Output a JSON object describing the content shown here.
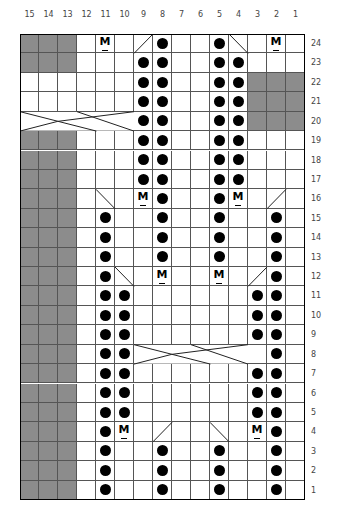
{
  "chart_data": {
    "type": "table",
    "title": "",
    "columns": [
      "15",
      "14",
      "13",
      "12",
      "11",
      "10",
      "9",
      "8",
      "7",
      "6",
      "5",
      "4",
      "3",
      "2",
      "1"
    ],
    "rows": [
      "24",
      "23",
      "22",
      "21",
      "20",
      "19",
      "18",
      "17",
      "16",
      "15",
      "14",
      "13",
      "12",
      "11",
      "10",
      "9",
      "8",
      "7",
      "6",
      "5",
      "4",
      "3",
      "2",
      "1"
    ],
    "legend": {
      "dot": "purl / bobble",
      "M": "make one",
      "grey": "no stitch",
      "slash": "decrease",
      "cable": "cable cross"
    },
    "grey_cells": {
      "24": [
        15,
        14,
        13
      ],
      "23": [
        15,
        14,
        13
      ],
      "22": [
        3,
        2,
        1
      ],
      "21": [
        3,
        2,
        1
      ],
      "20": [
        3,
        2,
        1
      ],
      "19": [
        15,
        14,
        13
      ],
      "18": [
        15,
        14,
        13
      ],
      "17": [
        15,
        14,
        13
      ],
      "16": [
        15,
        14,
        13
      ],
      "15": [
        15,
        14,
        13
      ],
      "14": [
        15,
        14,
        13
      ],
      "13": [
        15,
        14,
        13
      ],
      "12": [
        15,
        14,
        13
      ],
      "11": [
        15,
        14,
        13
      ],
      "10": [
        15,
        14,
        13
      ],
      "9": [
        15,
        14,
        13
      ],
      "8": [
        15,
        14,
        13
      ],
      "7": [
        15,
        14,
        13
      ],
      "6": [
        15,
        14,
        13
      ],
      "5": [
        15,
        14,
        13
      ],
      "4": [
        15,
        14,
        13
      ],
      "3": [
        15,
        14,
        13
      ],
      "2": [
        15,
        14,
        13
      ],
      "1": [
        15,
        14,
        13
      ]
    },
    "dots": {
      "24": [
        8,
        5
      ],
      "23": [
        9,
        8,
        5,
        4
      ],
      "22": [
        9,
        8,
        5,
        4
      ],
      "21": [
        9,
        8,
        5,
        4
      ],
      "20": [
        9,
        8,
        5,
        4
      ],
      "19": [
        9,
        8,
        5,
        4
      ],
      "18": [
        9,
        8,
        5,
        4
      ],
      "17": [
        9,
        8,
        5,
        4
      ],
      "16": [
        8,
        5
      ],
      "15": [
        11,
        8,
        5,
        2
      ],
      "14": [
        11,
        8,
        5,
        2
      ],
      "13": [
        11,
        8,
        5,
        2
      ],
      "12": [
        11,
        2
      ],
      "11": [
        11,
        10,
        3,
        2
      ],
      "10": [
        11,
        10,
        3,
        2
      ],
      "9": [
        11,
        10,
        3,
        2
      ],
      "8": [
        11,
        10,
        2
      ],
      "7": [
        11,
        10,
        3,
        2
      ],
      "6": [
        11,
        10,
        3,
        2
      ],
      "5": [
        11,
        10,
        3,
        2
      ],
      "4": [
        11,
        2
      ],
      "3": [
        11,
        8,
        5,
        2
      ],
      "2": [
        11,
        8,
        5,
        2
      ],
      "1": [
        11,
        8,
        5,
        2
      ]
    },
    "m_cells": {
      "24": [
        11,
        2
      ],
      "16": [
        9,
        4
      ],
      "12": [
        8,
        5
      ],
      "4": [
        10,
        3
      ]
    },
    "diagonals": [
      {
        "row": 24,
        "col": 9,
        "dir": "/"
      },
      {
        "row": 24,
        "col": 4,
        "dir": "\\"
      },
      {
        "row": 16,
        "col": 11,
        "dir": "\\"
      },
      {
        "row": 16,
        "col": 2,
        "dir": "/"
      },
      {
        "row": 12,
        "col": 10,
        "dir": "\\"
      },
      {
        "row": 12,
        "col": 3,
        "dir": "/"
      },
      {
        "row": 4,
        "col": 8,
        "dir": "/"
      },
      {
        "row": 4,
        "col": 5,
        "dir": "\\"
      }
    ],
    "cables": [
      {
        "row": 20,
        "cols": [
          15,
          10
        ]
      },
      {
        "row": 8,
        "cols": [
          9,
          4
        ]
      }
    ]
  },
  "labels": {
    "m_symbol": "M"
  }
}
